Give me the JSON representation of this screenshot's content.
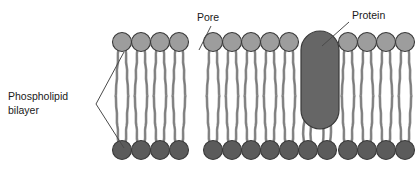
{
  "figure": {
    "background_color": "#ffffff"
  },
  "labels": {
    "phospholipid_bilayer_line1": "Phospholipid",
    "phospholipid_bilayer_line2": "bilayer",
    "pore": "Pore",
    "protein": "Protein"
  },
  "colors": {
    "head_upper": "#9d9d9d",
    "head_lower": "#5b5b5b",
    "head_outline": "#3a3a3a",
    "tail": "#9a9a9a",
    "tail_outline": "#6e6e6e",
    "protein_fill": "#666666",
    "protein_outline": "#3a3a3a",
    "leader_line": "#4a4a4a",
    "text": "#1a1a1a"
  },
  "structure": {
    "left_patch": {
      "upper_leaflet_head_count": 4,
      "lower_leaflet_head_count": 4,
      "head_radius": 9.5,
      "upper_head_cy": 42,
      "lower_head_cy": 150,
      "head_spacing": 19,
      "first_head_cx": 122
    },
    "right_patch": {
      "upper_leaflet_head_count": 9,
      "lower_leaflet_head_count": 11,
      "head_radius": 9.5,
      "upper_head_cy": 42,
      "lower_head_cy": 150,
      "head_spacing": 19,
      "first_head_cx": 213
    },
    "protein": {
      "shape": "stadium",
      "x": 301,
      "y": 31,
      "width": 38,
      "height": 98,
      "corner_radius": 19,
      "spans_bilayer": true,
      "forms_pore": true
    },
    "pore": {
      "description": "channel through the bilayer alongside the protein",
      "position_cx": 320
    }
  },
  "leaders": {
    "pore": {
      "x1": 211,
      "y1": 26,
      "x2": 199,
      "y2": 50
    },
    "protein": {
      "x1": 348,
      "y1": 22,
      "x2": 323,
      "y2": 46
    },
    "bracket_apex_x": 96,
    "bracket_apex_y": 104,
    "bracket_upper_x": 124,
    "bracket_upper_y": 52,
    "bracket_lower_x": 124,
    "bracket_lower_y": 148
  }
}
